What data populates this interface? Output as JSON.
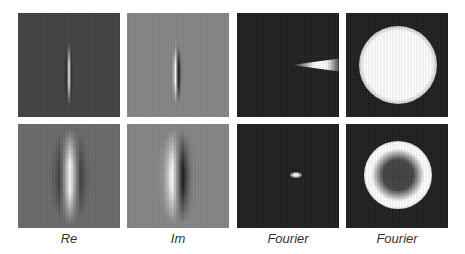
{
  "figure": {
    "grid": {
      "rows": 2,
      "columns": 4
    },
    "columns": [
      {
        "label": "Re",
        "description": "Real part of Gabor filter"
      },
      {
        "label": "Im",
        "description": "Imaginary part of Gabor filter"
      },
      {
        "label": "Fourier",
        "description": "Fourier magnitude (oriented wedge / small dot)"
      },
      {
        "label": "Fourier",
        "description": "Fourier magnitude (disc / ring)"
      }
    ],
    "rows": [
      {
        "panels": [
          "small-gabor-real",
          "small-gabor-imag",
          "wedge-spectrum",
          "disc-spectrum"
        ]
      },
      {
        "panels": [
          "large-gabor-real",
          "large-gabor-imag",
          "dot-spectrum",
          "ring-spectrum"
        ]
      }
    ],
    "colors": {
      "background": "#ffffff",
      "dark_panel": "#1e1e1e",
      "gray_panel": "#868686",
      "label_text": "#333333"
    }
  }
}
